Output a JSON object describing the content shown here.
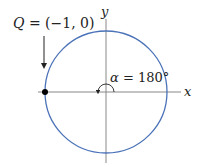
{
  "diagram": {
    "point_label": "Q = (−1, 0)",
    "point_label_parts": {
      "var": "Q",
      "rest": " = (−1, 0)"
    },
    "angle_label": "α = 180°",
    "angle_label_parts": {
      "var": "α",
      "rest": " = 180°"
    },
    "x_axis_label": "x",
    "y_axis_label": "y",
    "circle_color": "#4a72b8",
    "axis_color": "#888888",
    "point_color": "#000000",
    "circle": {
      "cx": 106,
      "cy": 92,
      "r": 61
    },
    "point": {
      "x": 45,
      "y": 92
    },
    "angle_degrees": 180
  }
}
